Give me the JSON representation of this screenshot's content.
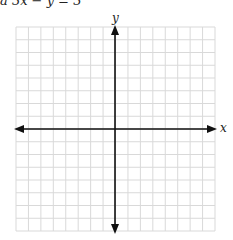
{
  "equation": {
    "text": "a  3x  −  y  =  3"
  },
  "graph": {
    "x_label": "x",
    "y_label": "y",
    "grid_cells_x": 16,
    "grid_cells_y": 16,
    "grid_color": "#d9d9d9",
    "axis_color": "#111111"
  }
}
